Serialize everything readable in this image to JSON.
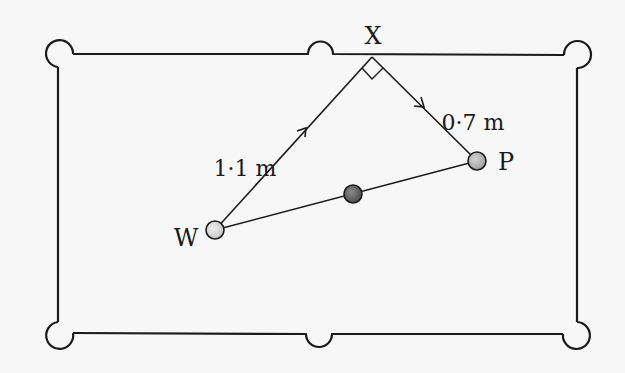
{
  "diagram": {
    "type": "snooker-table-geometry",
    "background": "#f7f7f7",
    "stroke_color": "#1a1a1a",
    "labels": {
      "point_x": "X",
      "point_w": "W",
      "point_p": "P",
      "length_wx": "1·1 m",
      "length_xp": "0·7 m"
    },
    "balls": {
      "w": {
        "label": "W",
        "fill": "#d6d6d6"
      },
      "object": {
        "label": "",
        "fill": "#6b6b6b"
      },
      "p": {
        "label": "P",
        "fill": "#b4b4b4"
      }
    },
    "segments": [
      {
        "from": "W",
        "to": "X",
        "length": "1·1 m",
        "arrow": true
      },
      {
        "from": "X",
        "to": "P",
        "length": "0·7 m",
        "arrow": true
      },
      {
        "from": "W",
        "to": "P",
        "length": "",
        "arrow": false
      }
    ],
    "angle_marker": {
      "at": "X",
      "type": "right-angle"
    },
    "pockets": [
      "top-left",
      "top-middle",
      "top-right",
      "bottom-left",
      "bottom-middle",
      "bottom-right"
    ]
  }
}
